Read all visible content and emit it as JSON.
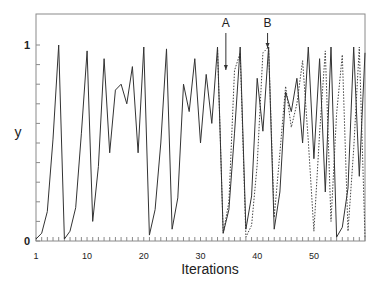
{
  "chart_data": {
    "type": "line",
    "title": "",
    "xlabel": "Iterations",
    "ylabel": "y",
    "xlim": [
      1,
      59
    ],
    "ylim": [
      0,
      1.1
    ],
    "grid": false,
    "legend": null,
    "x_tick_labels": [
      "1",
      "10",
      "20",
      "30",
      "40",
      "50"
    ],
    "x_tick_values": [
      1,
      10,
      20,
      30,
      40,
      50
    ],
    "y_tick_labels": [
      "0",
      "1"
    ],
    "y_tick_values": [
      0,
      1
    ],
    "y_minor_tick_step": 0.1,
    "x_minor_tick_step": 1,
    "annotations": [
      {
        "label": "A",
        "x": 35,
        "arrow_to_y": 0.87
      },
      {
        "label": "B",
        "x": 42,
        "arrow_to_y": 0.99
      }
    ],
    "series": [
      {
        "name": "solid",
        "style": "solid",
        "x": [
          1,
          2,
          3,
          4,
          5,
          6,
          7,
          8,
          9,
          10,
          11,
          12,
          13,
          14,
          15,
          16,
          17,
          18,
          19,
          20,
          21,
          22,
          23,
          24,
          25,
          26,
          27,
          28,
          29,
          30,
          31,
          32,
          33,
          34,
          35,
          36,
          37,
          38,
          39,
          40,
          41,
          42,
          43,
          44,
          45,
          46,
          47,
          48,
          49,
          50,
          51,
          52,
          53,
          54,
          55,
          56,
          57,
          58,
          59
        ],
        "values": [
          0.01,
          0.04,
          0.15,
          0.52,
          1.0,
          0.01,
          0.05,
          0.17,
          0.55,
          0.97,
          0.1,
          0.38,
          0.93,
          0.45,
          0.77,
          0.8,
          0.7,
          0.89,
          0.45,
          0.99,
          0.03,
          0.16,
          0.5,
          0.98,
          0.06,
          0.22,
          0.8,
          0.66,
          0.93,
          0.5,
          0.85,
          0.6,
          0.99,
          0.04,
          0.16,
          0.55,
          0.99,
          0.06,
          0.23,
          0.83,
          0.56,
          0.99,
          0.06,
          0.25,
          0.76,
          0.66,
          0.83,
          0.5,
          0.99,
          0.42,
          0.93,
          0.25,
          0.99,
          0.02,
          0.07,
          0.27,
          0.99,
          0.33,
          0.96
        ]
      },
      {
        "name": "dashed",
        "style": "dashed",
        "x": [
          33,
          34,
          35,
          36,
          37,
          38,
          39,
          40,
          41,
          42,
          43,
          44,
          45,
          46,
          47,
          48,
          49,
          50,
          51,
          52,
          53,
          54,
          55,
          56,
          57,
          58,
          59
        ],
        "values": [
          0.99,
          0.04,
          0.2,
          0.87,
          0.96,
          0.02,
          0.08,
          0.39,
          0.96,
          0.99,
          0.12,
          0.45,
          0.79,
          0.58,
          0.7,
          0.92,
          0.51,
          0.05,
          0.55,
          0.97,
          0.1,
          0.65,
          0.95,
          0.05,
          0.47,
          0.99,
          0.02
        ]
      }
    ]
  },
  "colors": {
    "line": "#333333",
    "axis": "#888888",
    "text": "#222222"
  }
}
